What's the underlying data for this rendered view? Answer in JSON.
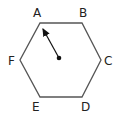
{
  "diagram": {
    "shape": "regular hexagon",
    "vertices": [
      {
        "label": "A",
        "x": 40,
        "y": 23,
        "lx": 33,
        "ly": 17
      },
      {
        "label": "B",
        "x": 82,
        "y": 23,
        "lx": 80,
        "ly": 17
      },
      {
        "label": "C",
        "x": 101,
        "y": 60,
        "lx": 104,
        "ly": 65
      },
      {
        "label": "D",
        "x": 82,
        "y": 97,
        "lx": 81,
        "ly": 111
      },
      {
        "label": "E",
        "x": 40,
        "y": 97,
        "lx": 32,
        "ly": 111
      },
      {
        "label": "F",
        "x": 20,
        "y": 60,
        "lx": 8,
        "ly": 65
      }
    ],
    "center": {
      "x": 59,
      "y": 58
    },
    "arrow": {
      "from": "center",
      "to": "A",
      "tip_x": 42,
      "tip_y": 27
    },
    "colors": {
      "stroke": "#555555",
      "text": "#222222",
      "dot": "#111111"
    }
  }
}
